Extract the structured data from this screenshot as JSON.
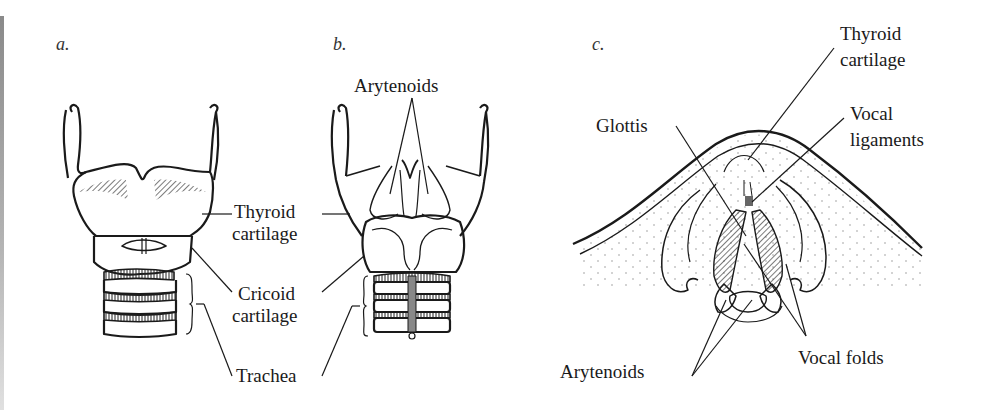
{
  "figure": {
    "panels": [
      {
        "letter": "a.",
        "view": "anterior view of larynx",
        "labels": {
          "thyroid_line1": "Thyroid",
          "thyroid_line2": "cartilage",
          "cricoid_line1": "Cricoid",
          "cricoid_line2": "cartilage",
          "trachea": "Trachea"
        }
      },
      {
        "letter": "b.",
        "view": "posterior view of larynx",
        "labels": {
          "arytenoids": "Arytenoids"
        }
      },
      {
        "letter": "c.",
        "view": "superior view of glottis",
        "labels": {
          "thyroid_line1": "Thyroid",
          "thyroid_line2": "cartilage",
          "vocal_ligaments_line1": "Vocal",
          "vocal_ligaments_line2": "ligaments",
          "glottis": "Glottis",
          "arytenoids": "Arytenoids",
          "vocal_folds": "Vocal folds"
        }
      }
    ],
    "colors": {
      "ink": "#1a1a1a",
      "background": "#ffffff",
      "stipple": "#9a9a9a"
    }
  }
}
